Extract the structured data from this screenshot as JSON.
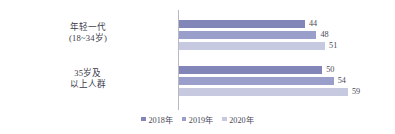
{
  "chart_data": {
    "type": "bar",
    "orientation": "horizontal",
    "title": "",
    "subtitle": "",
    "xlabel": "",
    "ylabel": "",
    "grid": false,
    "legend_position": "bottom-center",
    "xlim": [
      0,
      66
    ],
    "categories": [
      "年轻一代\n(18~34岁)",
      "35岁及\n以上人群"
    ],
    "category_lines": [
      [
        "年轻一代",
        "(18~34岁)"
      ],
      [
        "35岁及",
        "以上人群"
      ]
    ],
    "series": [
      {
        "name": "2018年",
        "color": "#8185b8",
        "values": [
          44,
          50
        ]
      },
      {
        "name": "2019年",
        "color": "#9a9ecb",
        "values": [
          48,
          54
        ]
      },
      {
        "name": "2020年",
        "color": "#c7c9e0",
        "values": [
          51,
          59
        ]
      }
    ],
    "data_labels": [
      {
        "series": "2018年",
        "category": "年轻一代(18~34岁)",
        "value": 44,
        "text": "44"
      },
      {
        "series": "2019年",
        "category": "年轻一代(18~34岁)",
        "value": 48,
        "text": "48"
      },
      {
        "series": "2020年",
        "category": "年轻一代(18~34岁)",
        "value": 51,
        "text": "51"
      },
      {
        "series": "2018年",
        "category": "35岁及以上人群",
        "value": 50,
        "text": "50"
      },
      {
        "series": "2019年",
        "category": "35岁及以上人群",
        "value": 54,
        "text": "54"
      },
      {
        "series": "2020年",
        "category": "35岁及以上人群",
        "value": 59,
        "text": "59"
      }
    ]
  },
  "legend": {
    "items": [
      {
        "label": "2018年",
        "color": "#8185b8"
      },
      {
        "label": "2019年",
        "color": "#9a9ecb"
      },
      {
        "label": "2020年",
        "color": "#c7c9e0"
      }
    ]
  },
  "axis": {
    "line_color": "#b9b9c6"
  }
}
